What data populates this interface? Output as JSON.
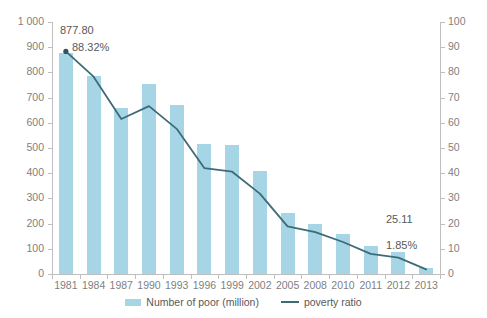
{
  "chart_data": {
    "type": "bar",
    "title": "",
    "subtitle": "",
    "xlabel": "",
    "ylabel": "",
    "y2label": "",
    "grid": false,
    "legend_position": "bottom-center",
    "categories": [
      "1981",
      "1984",
      "1987",
      "1990",
      "1993",
      "1996",
      "1999",
      "2002",
      "2005",
      "2008",
      "2010",
      "2011",
      "2012",
      "2013"
    ],
    "ylim": [
      0,
      1000
    ],
    "y_ticks": [
      "0",
      "100",
      "200",
      "300",
      "400",
      "500",
      "600",
      "700",
      "800",
      "900",
      "1 000"
    ],
    "y2lim": [
      0,
      100
    ],
    "y2_ticks": [
      "0",
      "10",
      "20",
      "30",
      "40",
      "50",
      "60",
      "70",
      "80",
      "90",
      "100"
    ],
    "series": [
      {
        "name": "Number of poor (million)",
        "type": "bar",
        "axis": "left",
        "color": "#a6d5e6",
        "values": [
          877.8,
          785,
          660,
          755,
          672,
          515,
          510,
          410,
          244,
          200,
          157,
          111,
          89,
          25.11
        ]
      },
      {
        "name": "poverty ratio",
        "type": "line",
        "axis": "right",
        "color": "#3e6b78",
        "values": [
          88.32,
          78.3,
          61.5,
          66.6,
          57.6,
          42.0,
          40.6,
          31.9,
          18.9,
          16.6,
          12.7,
          8.0,
          6.5,
          1.85
        ]
      }
    ],
    "annotations": [
      {
        "id": "peak-value",
        "text": "877.80"
      },
      {
        "id": "peak-ratio",
        "text": "88.32%"
      },
      {
        "id": "last-value",
        "text": "25.11"
      },
      {
        "id": "last-ratio",
        "text": "1.85%"
      }
    ]
  },
  "legend": {
    "items": [
      {
        "label": "Number of poor (million)",
        "marker": "bar-swatch",
        "color": "#a6d5e6"
      },
      {
        "label": "poverty ratio",
        "marker": "line-swatch",
        "color": "#3e6b78"
      }
    ]
  },
  "annotations": {
    "peak_value": "877.80",
    "peak_ratio": "88.32%",
    "last_value": "25.11",
    "last_ratio": "1.85%"
  },
  "colors": {
    "bar": "#a6d5e6",
    "line": "#3e6b78",
    "axis": "#bfbfbf",
    "tick_text": "#7f7f7f",
    "annotation_text": "#595959",
    "background": "#ffffff"
  }
}
